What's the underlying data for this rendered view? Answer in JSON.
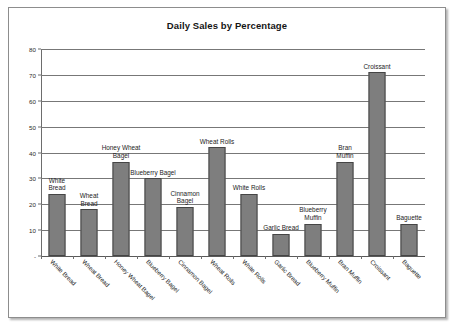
{
  "chart_data": {
    "type": "bar",
    "title": "Daily Sales by Percentage",
    "xlabel": "",
    "ylabel": "",
    "ylim": [
      0,
      80
    ],
    "yticks": [
      "-",
      "10",
      "20",
      "30",
      "40",
      "50",
      "60",
      "70",
      "80"
    ],
    "grid": true,
    "legend": "none",
    "orientation": "vertical",
    "bar_color": "#7e7e7e",
    "bar_border_color": "#454545",
    "categories": [
      "White Bread",
      "Wheat Bread",
      "Honey Wheat Bagel",
      "Blueberry Bagel",
      "Cinnamon Bagel",
      "Wheat Rolls",
      "White Rolls",
      "Garlic Bread",
      "Blueberry Muffin",
      "Bran Muffin",
      "Croissant",
      "Baguette"
    ],
    "values": [
      24,
      18,
      36.5,
      30,
      19,
      42,
      24,
      8.5,
      12.5,
      36.5,
      71,
      12.5
    ],
    "point_labels": [
      "White\nBread",
      "Wheat\nBread",
      "Honey Wheat\nBagel",
      "Blueberry Bagel",
      "Cinnamon\nBagel",
      "Wheat Rolls",
      "White Rolls",
      "Garlic Bread",
      "Blueberry\nMuffin",
      "Bran\nMuffin",
      "Croissant",
      "Baguette"
    ]
  }
}
